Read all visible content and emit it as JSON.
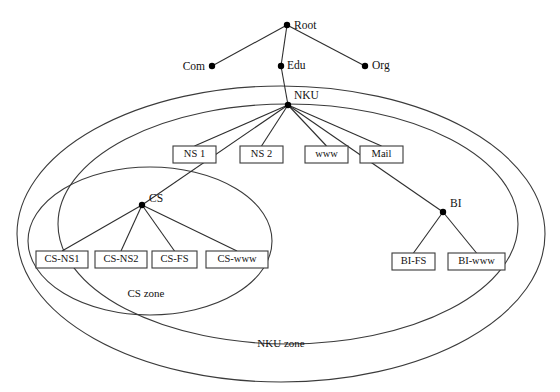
{
  "diagram": {
    "colors": {
      "stroke": "#3b3b3b",
      "edge": "#2e2e2e",
      "node": "#000000",
      "text": "#111111",
      "background": "#ffffff"
    },
    "nodes": [
      {
        "id": "root",
        "label": "Root",
        "x": 287,
        "y": 25,
        "label_dx": 7,
        "label_dy": 4,
        "anchor": "start"
      },
      {
        "id": "com",
        "label": "Com",
        "x": 212,
        "y": 66,
        "label_dx": -7,
        "label_dy": 4,
        "anchor": "end"
      },
      {
        "id": "edu",
        "label": "Edu",
        "x": 281,
        "y": 66,
        "label_dx": 6,
        "label_dy": 3,
        "anchor": "start"
      },
      {
        "id": "org",
        "label": "Org",
        "x": 365,
        "y": 66,
        "label_dx": 7,
        "label_dy": 3,
        "anchor": "start"
      },
      {
        "id": "nku",
        "label": "NKU",
        "x": 288,
        "y": 105,
        "label_dx": 6,
        "label_dy": -6,
        "anchor": "start"
      },
      {
        "id": "cs",
        "label": "CS",
        "x": 142,
        "y": 205,
        "label_dx": 7,
        "label_dy": -3,
        "anchor": "start"
      },
      {
        "id": "bi",
        "label": "BI",
        "x": 443,
        "y": 212,
        "label_dx": 7,
        "label_dy": -5,
        "anchor": "start"
      }
    ],
    "edges": [
      {
        "from": "root",
        "to": "com"
      },
      {
        "from": "root",
        "to": "edu"
      },
      {
        "from": "root",
        "to": "org"
      },
      {
        "from": "edu",
        "to": "nku"
      },
      {
        "from": "nku",
        "to": "ns1"
      },
      {
        "from": "nku",
        "to": "ns2"
      },
      {
        "from": "nku",
        "to": "www"
      },
      {
        "from": "nku",
        "to": "mail"
      },
      {
        "from": "nku",
        "to": "cs"
      },
      {
        "from": "nku",
        "to": "bi"
      },
      {
        "from": "cs",
        "to": "cs-ns1"
      },
      {
        "from": "cs",
        "to": "cs-ns2"
      },
      {
        "from": "cs",
        "to": "cs-fs"
      },
      {
        "from": "cs",
        "to": "cs-www"
      },
      {
        "from": "bi",
        "to": "bi-fs"
      },
      {
        "from": "bi",
        "to": "bi-www"
      }
    ],
    "host_boxes": [
      {
        "id": "ns1",
        "label": "NS 1",
        "x": 173,
        "y": 146,
        "w": 43,
        "h": 17
      },
      {
        "id": "ns2",
        "label": "NS 2",
        "x": 240,
        "y": 146,
        "w": 43,
        "h": 17
      },
      {
        "id": "www",
        "label": "www",
        "x": 305,
        "y": 146,
        "w": 43,
        "h": 17
      },
      {
        "id": "mail",
        "label": "Mail",
        "x": 360,
        "y": 146,
        "w": 43,
        "h": 17
      },
      {
        "id": "cs-ns1",
        "label": "CS-NS1",
        "x": 36,
        "y": 251,
        "w": 52,
        "h": 17
      },
      {
        "id": "cs-ns2",
        "label": "CS-NS2",
        "x": 95,
        "y": 251,
        "w": 52,
        "h": 17
      },
      {
        "id": "cs-fs",
        "label": "CS-FS",
        "x": 152,
        "y": 251,
        "w": 45,
        "h": 17
      },
      {
        "id": "cs-www",
        "label": "CS-www",
        "x": 206,
        "y": 251,
        "w": 62,
        "h": 17
      },
      {
        "id": "bi-fs",
        "label": "BI-FS",
        "x": 392,
        "y": 253,
        "w": 43,
        "h": 17
      },
      {
        "id": "bi-www",
        "label": "BI-www",
        "x": 448,
        "y": 253,
        "w": 57,
        "h": 17
      }
    ],
    "zones": [
      {
        "id": "nku-zone-outer",
        "label": "NKU zone",
        "cx": 281,
        "cy": 234,
        "rx": 264,
        "ry": 148,
        "label_x": 281,
        "label_y": 347
      },
      {
        "id": "nku-zone-inner",
        "label": "",
        "cx": 288,
        "cy": 224,
        "rx": 230,
        "ry": 120,
        "label_x": 0,
        "label_y": 0
      },
      {
        "id": "cs-zone",
        "label": "CS zone",
        "cx": 150,
        "cy": 241,
        "rx": 122,
        "ry": 74,
        "label_x": 146,
        "label_y": 297
      }
    ]
  }
}
